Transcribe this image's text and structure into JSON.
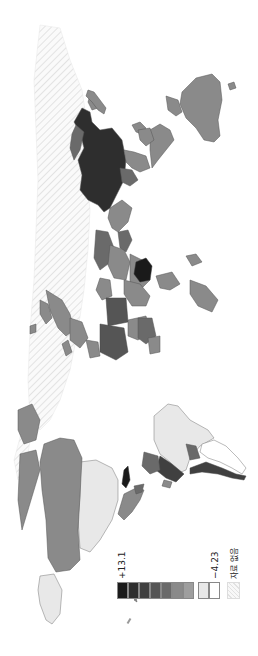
{
  "map": {
    "orientation": "rotated 90° counter-clockwise (north at left)",
    "projection": "world choropleth",
    "no_data_pattern": "diagonal hatch"
  },
  "legend": {
    "max_label": "+13.1",
    "min_label": "−4.23",
    "no_data_label": "자료 없음",
    "colors": [
      "#1a1a1a",
      "#2e2e2e",
      "#404040",
      "#555555",
      "#6a6a6a",
      "#8a8a8a",
      "#9e9e9e",
      "#e8e8e8",
      "#ffffff"
    ],
    "no_data_color": "#f2f2f2"
  },
  "regions": {
    "china": "#2e2e2e",
    "australia": "#8a8a8a",
    "india": "#6a6a6a",
    "russia": "no-data",
    "dr_congo": "#1a1a1a",
    "canada": "#8a8a8a",
    "usa": "#e8e8e8",
    "alaska": "#e8e8e8",
    "brazil": "#e8e8e8",
    "argentina": "#ffffff",
    "chile": "#404040",
    "peru_bolivia": "#404040"
  }
}
